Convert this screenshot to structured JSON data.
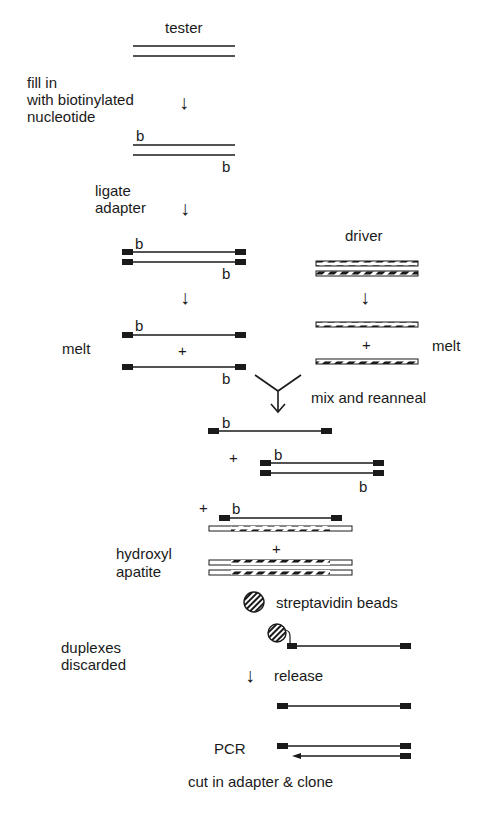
{
  "diagram": {
    "labels": {
      "tester": "tester",
      "fill_in": "fill in",
      "with_biotinylated": "with biotinylated",
      "nucleotide": "nucleotide",
      "ligate": "ligate",
      "adapter": "adapter",
      "driver": "driver",
      "melt_left": "melt",
      "melt_right": "melt",
      "mix_reanneal": "mix and reanneal",
      "hydroxyl": "hydroxyl",
      "apatite": "apatite",
      "streptavidin_beads": "streptavidin beads",
      "duplexes": "duplexes",
      "discarded": "discarded",
      "release": "release",
      "pcr": "PCR",
      "cut_clone": "cut in adapter & clone"
    },
    "biotin_marker": "b",
    "plus_sign": "+",
    "down_arrow": "↓",
    "colors": {
      "ink": "#1a1a1a",
      "background": "#ffffff"
    }
  }
}
